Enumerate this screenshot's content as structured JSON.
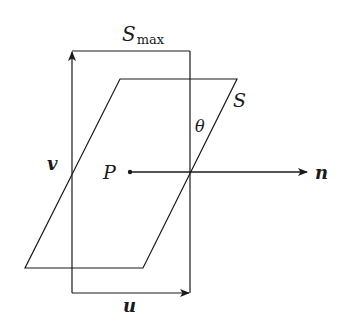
{
  "diagram": {
    "colors": {
      "background": "#ffffff",
      "stroke": "#1a1a1a"
    },
    "labels": {
      "s_max_main": "S",
      "s_max_sub": "max",
      "s": "S",
      "theta": "θ",
      "v": "v",
      "p": "P",
      "n": "n",
      "u": "u"
    },
    "shapes": {
      "rectangle_s_max": {
        "x1": 72,
        "y1": 51,
        "x2": 190,
        "y2": 293
      },
      "parallelogram_s": [
        [
          120,
          79
        ],
        [
          237,
          79
        ],
        [
          143,
          268
        ],
        [
          25,
          268
        ]
      ],
      "point_p": [
        130,
        172
      ],
      "normal_n_end": [
        307,
        172
      ]
    }
  }
}
